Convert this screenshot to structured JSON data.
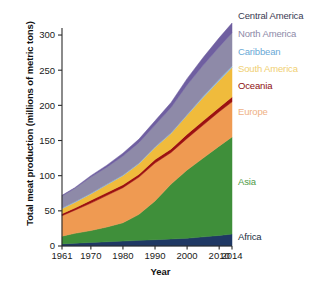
{
  "chart_data": {
    "type": "area",
    "title": "",
    "xlabel": "Year",
    "ylabel": "Total meat production (millions of metric tons)",
    "xlim": [
      1961,
      2014
    ],
    "ylim": [
      0,
      310
    ],
    "xticks": [
      1961,
      1970,
      1980,
      1990,
      2000,
      2010,
      2014
    ],
    "yticks": [
      0,
      50,
      100,
      150,
      200,
      250,
      300
    ],
    "grid": false,
    "legend_position": "right",
    "stacked": true,
    "x": [
      1961,
      1965,
      1970,
      1975,
      1980,
      1985,
      1990,
      1995,
      2000,
      2005,
      2010,
      2014
    ],
    "series": [
      {
        "name": "Africa",
        "color": "#1f3864",
        "values": [
          3,
          4,
          5,
          6,
          7,
          8,
          9,
          10,
          11,
          13,
          15,
          17
        ]
      },
      {
        "name": "Asia",
        "color": "#3f8f3a",
        "values": [
          11,
          14,
          17,
          21,
          26,
          37,
          55,
          78,
          97,
          112,
          127,
          138
        ]
      },
      {
        "name": "Europe",
        "color": "#ef9a52",
        "values": [
          29,
          33,
          39,
          45,
          50,
          53,
          54,
          45,
          45,
          47,
          49,
          50
        ]
      },
      {
        "name": "Oceania",
        "color": "#9c1111",
        "values": [
          3,
          3,
          4,
          4,
          4,
          4,
          5,
          5,
          6,
          6,
          6,
          7
        ]
      },
      {
        "name": "South America",
        "color": "#f0bb3c",
        "values": [
          7,
          8,
          9,
          11,
          13,
          15,
          17,
          22,
          27,
          33,
          38,
          42
        ]
      },
      {
        "name": "Caribbean",
        "color": "#8fbfe0",
        "values": [
          1,
          1,
          1,
          1,
          1,
          1,
          1,
          1,
          1,
          2,
          2,
          2
        ]
      },
      {
        "name": "North America",
        "color": "#8e8aa8",
        "values": [
          17,
          19,
          23,
          24,
          27,
          29,
          31,
          36,
          42,
          44,
          46,
          47
        ]
      },
      {
        "name": "Central America",
        "color": "#6f5fa0",
        "values": [
          1,
          1,
          2,
          3,
          4,
          5,
          6,
          7,
          9,
          11,
          13,
          14
        ]
      }
    ],
    "legend": [
      {
        "label": "Central America",
        "color": "#3a3a52",
        "text_color": "#3a3a52"
      },
      {
        "label": "North America",
        "color": "#8e8aa8",
        "text_color": "#8e8aa8"
      },
      {
        "label": "Caribbean",
        "color": "#6aa9d6",
        "text_color": "#6aa9d6"
      },
      {
        "label": "South America",
        "color": "#f0cf72",
        "text_color": "#f0cf72"
      },
      {
        "label": "Oceania",
        "color": "#8e1010",
        "text_color": "#8e1010"
      },
      {
        "label": "Europe",
        "color": "#efb184",
        "text_color": "#efb184"
      },
      {
        "label": "Asia",
        "color": "#4f9a46",
        "text_color": "#4f9a46"
      },
      {
        "label": "Africa",
        "color": "#1f3864",
        "text_color": "#23303f"
      }
    ],
    "annotations": []
  },
  "axes": {
    "y_tick_labels": [
      "300",
      "250",
      "200",
      "150",
      "100",
      "50",
      "0"
    ],
    "x_tick_labels": [
      "1961",
      "1970",
      "1980",
      "1990",
      "2000",
      "2010",
      "2014"
    ],
    "x_axis_title": "Year",
    "y_axis_title": "Total meat production (millions of metric tons)"
  },
  "legend_labels": {
    "central_america": "Central America",
    "north_america": "North America",
    "caribbean": "Caribbean",
    "south_america": "South America",
    "oceania": "Oceania",
    "europe": "Europe",
    "asia": "Asia",
    "africa": "Africa"
  }
}
